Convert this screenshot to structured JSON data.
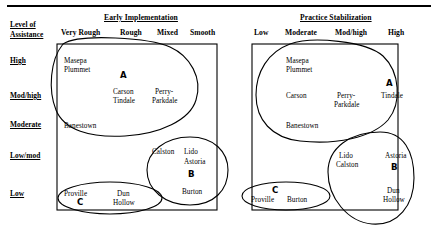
{
  "figure": {
    "title_rule": "",
    "axis_corner_label_line1": "Level of",
    "axis_corner_label_line2": "Assistance",
    "row_headers": [
      {
        "label": "High"
      },
      {
        "label": "Mod/high"
      },
      {
        "label": "Moderate"
      },
      {
        "label": "Low/mod"
      },
      {
        "label": "Low"
      }
    ]
  },
  "panels": [
    {
      "id": "early-implementation",
      "title": "Early Implementation",
      "column_headers": [
        "Very Rough",
        "Rough",
        "Mixed",
        "Smooth"
      ],
      "cells": [
        {
          "name": "masepa",
          "text": "Masepa"
        },
        {
          "name": "plummet",
          "text": "Plummet"
        },
        {
          "name": "carson",
          "text": "Carson"
        },
        {
          "name": "tindale",
          "text": "Tindale"
        },
        {
          "name": "perry",
          "text": "Perry-"
        },
        {
          "name": "parkdale",
          "text": "Parkdale"
        },
        {
          "name": "banestown",
          "text": "Banestown"
        },
        {
          "name": "calston",
          "text": "Calston"
        },
        {
          "name": "lido",
          "text": "Lido"
        },
        {
          "name": "astoria",
          "text": "Astoria"
        },
        {
          "name": "burton",
          "text": "Burton"
        },
        {
          "name": "proville",
          "text": "Proville"
        },
        {
          "name": "dun",
          "text": "Dun"
        },
        {
          "name": "hollow",
          "text": "Hollow"
        }
      ],
      "region_tags": [
        "A",
        "B",
        "C"
      ]
    },
    {
      "id": "practice-stabilization",
      "title": "Practice Stabilization",
      "column_headers": [
        "Low",
        "Moderate",
        "Mod/high",
        "High"
      ],
      "cells": [
        {
          "name": "masepa",
          "text": "Masepa"
        },
        {
          "name": "plummet",
          "text": "Plummet"
        },
        {
          "name": "carson",
          "text": "Carson"
        },
        {
          "name": "perry",
          "text": "Perry-"
        },
        {
          "name": "parkdale",
          "text": "Parkdale"
        },
        {
          "name": "tindale",
          "text": "Tindale"
        },
        {
          "name": "banestown",
          "text": "Banestown"
        },
        {
          "name": "lido",
          "text": "Lido"
        },
        {
          "name": "calston",
          "text": "Calston"
        },
        {
          "name": "astoria",
          "text": "Astoria"
        },
        {
          "name": "dun",
          "text": "Dun"
        },
        {
          "name": "hollow",
          "text": "Hollow"
        },
        {
          "name": "proville",
          "text": "Proville"
        },
        {
          "name": "burton",
          "text": "Burton"
        }
      ],
      "region_tags": [
        "C",
        "B",
        "A"
      ]
    }
  ],
  "colors": {
    "ink": "#000000",
    "paper": "#ffffff"
  }
}
